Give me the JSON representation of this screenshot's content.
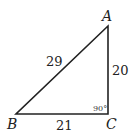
{
  "diagram": {
    "type": "right-triangle",
    "vertices": [
      {
        "label": "A",
        "x": 108,
        "y": 26
      },
      {
        "label": "B",
        "x": 16,
        "y": 114
      },
      {
        "label": "C",
        "x": 108,
        "y": 114
      }
    ],
    "sides": {
      "AB": "29",
      "AC": "20",
      "BC": "21"
    },
    "right_angle": {
      "vertex": "C",
      "label": "90°"
    },
    "colors": {
      "stroke": "#222222",
      "background": "#ffffff"
    }
  }
}
